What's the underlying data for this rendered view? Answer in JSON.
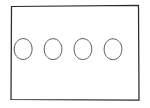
{
  "document": {
    "kind": "hand-drawn-sketch",
    "title": "Rectangle with four circles",
    "background_color": "#ffffff"
  },
  "diagram": {
    "name": "rectangle-with-four-circles",
    "stroke_color": "#2b2b2b",
    "node_stroke_color": "#4a4a4a",
    "fill_color": "#ffffff",
    "frame": {
      "name": "outer-rectangle",
      "x": 11,
      "y": 6,
      "width": 127,
      "height": 94,
      "path": "M 11.5 6.5 L 138.5 5.5 L 139.0 100.0 L 11.0 99.5 Z"
    },
    "nodes": [
      {
        "name": "circle-1",
        "index": 1,
        "cx": 23,
        "cy": 49,
        "rx": 9,
        "ry": 10.5,
        "path": "M 23.2 38.6 C 28.3 38.6 32.2 43.3 32.1 49.2 C 32.0 55.1 28.0 59.6 22.9 59.5 C 17.9 59.4 14.1 54.8 14.2 49.0 C 14.3 43.2 18.2 38.6 23.2 38.6 Z"
      },
      {
        "name": "circle-2",
        "index": 2,
        "cx": 53,
        "cy": 49,
        "rx": 9,
        "ry": 10.5,
        "path": "M 53.1 38.7 C 58.2 38.8 62.0 43.4 61.9 49.3 C 61.8 55.2 57.8 59.7 52.8 59.5 C 47.8 59.4 44.0 54.7 44.2 48.9 C 44.3 43.1 48.1 38.6 53.1 38.7 Z"
      },
      {
        "name": "circle-3",
        "index": 3,
        "cx": 83,
        "cy": 49,
        "rx": 9,
        "ry": 10.5,
        "path": "M 83.0 38.6 C 88.1 38.7 91.9 43.3 91.8 49.2 C 91.7 55.2 87.7 59.7 82.6 59.5 C 77.6 59.4 73.9 54.7 74.1 48.8 C 74.2 43.0 78.0 38.5 83.0 38.6 Z"
      },
      {
        "name": "circle-4",
        "index": 4,
        "cx": 113,
        "cy": 49,
        "rx": 9,
        "ry": 10.5,
        "path": "M 113.1 38.8 C 118.2 38.9 122.0 43.5 121.9 49.4 C 121.8 55.3 117.8 59.8 112.7 59.6 C 107.7 59.5 104.0 54.8 104.1 49.0 C 104.3 43.2 108.1 38.7 113.1 38.8 Z"
      }
    ],
    "node_count": 4,
    "node_spacing": 30
  }
}
